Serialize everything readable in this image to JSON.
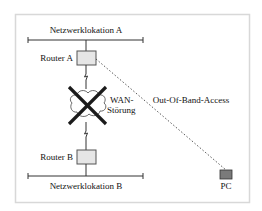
{
  "diagram": {
    "location_a": {
      "label": "Netzwerklokation A"
    },
    "location_b": {
      "label": "Netzwerklokation B"
    },
    "router_a": {
      "label": "Router A"
    },
    "router_b": {
      "label": "Router B"
    },
    "wan": {
      "label_line1": "WAN-",
      "label_line2": "Störung"
    },
    "oob_link": {
      "label": "Out-Of-Band-Access"
    },
    "pc": {
      "label": "PC"
    }
  },
  "colors": {
    "border": "#d8d8d8",
    "router_fill": "#e6e6e6",
    "pc_fill": "#7a7a7a",
    "line": "#222222"
  }
}
